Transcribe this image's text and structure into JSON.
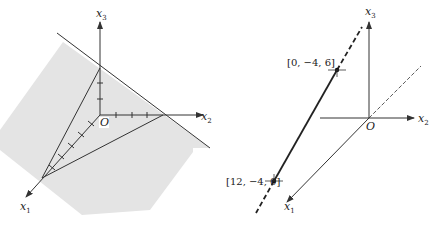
{
  "left_figure": {
    "axes": {
      "x1": {
        "label": "x",
        "sub": "1"
      },
      "x2": {
        "label": "x",
        "sub": "2"
      },
      "x3": {
        "label": "x",
        "sub": "3"
      }
    },
    "origin_label": "O",
    "description": "Shaded plane intersecting the three coordinate axes, forming a triangle",
    "colors": {
      "plane_fill": "#e4e4e4",
      "line": "#333333"
    }
  },
  "right_figure": {
    "axes": {
      "x1": {
        "label": "x",
        "sub": "1"
      },
      "x2": {
        "label": "x",
        "sub": "2"
      },
      "x3": {
        "label": "x",
        "sub": "3"
      }
    },
    "origin_label": "O",
    "points": [
      {
        "label": "[0, −4, 6]"
      },
      {
        "label": "[12, −4, 0]"
      }
    ],
    "description": "Line through two points, dashed extension beyond the segment"
  }
}
